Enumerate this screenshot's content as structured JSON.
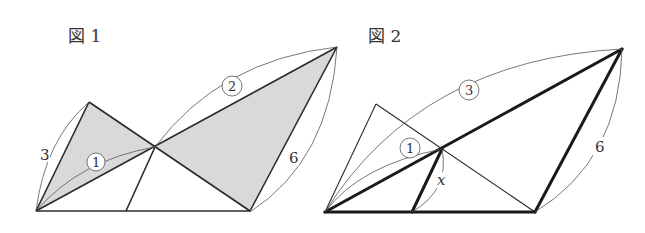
{
  "figures": [
    {
      "title": "図 1",
      "labels": {
        "side_left": "3",
        "ratio_inner": "1",
        "ratio_outer": "2",
        "side_right": "6"
      },
      "shading": "#d8d8d8"
    },
    {
      "title": "図 2",
      "labels": {
        "ratio_inner": "1",
        "ratio_outer": "3",
        "side_right": "6",
        "unknown": "x"
      }
    }
  ],
  "colors": {
    "line": "#2a2a2a",
    "thin": "#555555",
    "fill": "#d9d9d9"
  }
}
